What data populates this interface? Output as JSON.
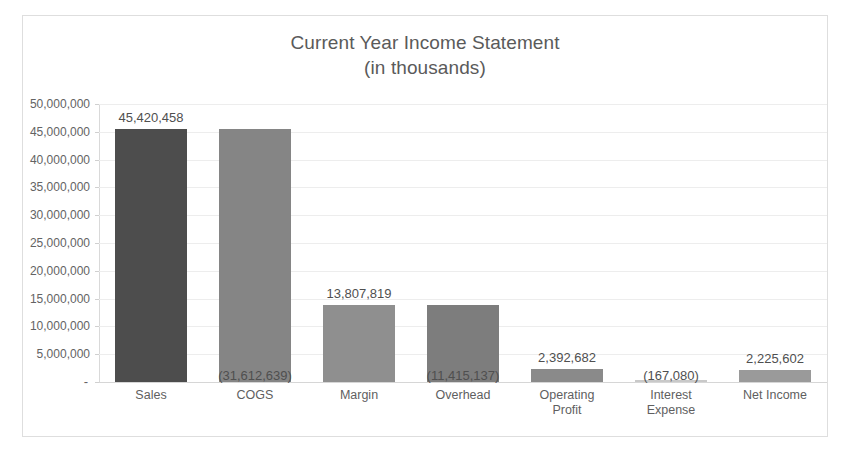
{
  "chart_data": {
    "type": "bar",
    "title": "Current Year Income Statement",
    "subtitle": "(in thousands)",
    "xlabel": "",
    "ylabel": "",
    "ylim": [
      0,
      50000000
    ],
    "grid": true,
    "legend": "none",
    "categories": [
      "Sales",
      "COGS",
      "Margin",
      "Overhead",
      "Operating Profit",
      "Interest Expense",
      "Net Income"
    ],
    "category_lines": [
      [
        "Sales",
        ""
      ],
      [
        "COGS",
        ""
      ],
      [
        "Margin",
        ""
      ],
      [
        "Overhead",
        ""
      ],
      [
        "Operating",
        "Profit"
      ],
      [
        "Interest",
        "Expense"
      ],
      [
        "Net Income",
        ""
      ]
    ],
    "values": [
      45420458,
      -31612639,
      13807819,
      -11415137,
      2392682,
      -167080,
      2225602
    ],
    "plotted_magnitudes": [
      45420458,
      45420458,
      13807819,
      13807819,
      2392682,
      167080,
      2225602
    ],
    "data_labels": [
      "45,420,458",
      "(31,612,639)",
      "13,807,819",
      "(11,415,137)",
      "2,392,682",
      "(167,080)",
      "2,225,602"
    ],
    "label_positions": [
      "above",
      "below",
      "above",
      "below",
      "above",
      "below",
      "above"
    ],
    "bar_colors": [
      "#4d4d4d",
      "#858585",
      "#8f8f8f",
      "#7d7d7d",
      "#8a8a8a",
      "#c9c9c9",
      "#9a9a9a"
    ],
    "ytick_labels": [
      "50,000,000",
      "45,000,000",
      "40,000,000",
      "35,000,000",
      "30,000,000",
      "25,000,000",
      "20,000,000",
      "15,000,000",
      "10,000,000",
      "5,000,000",
      "-"
    ],
    "ytick_values": [
      50000000,
      45000000,
      40000000,
      35000000,
      30000000,
      25000000,
      20000000,
      15000000,
      10000000,
      5000000,
      0
    ],
    "colors": {
      "title": "#5a5a5a",
      "axis_text": "#636363",
      "gridline": "#ededed",
      "border": "#dedede",
      "background": "#ffffff"
    }
  }
}
